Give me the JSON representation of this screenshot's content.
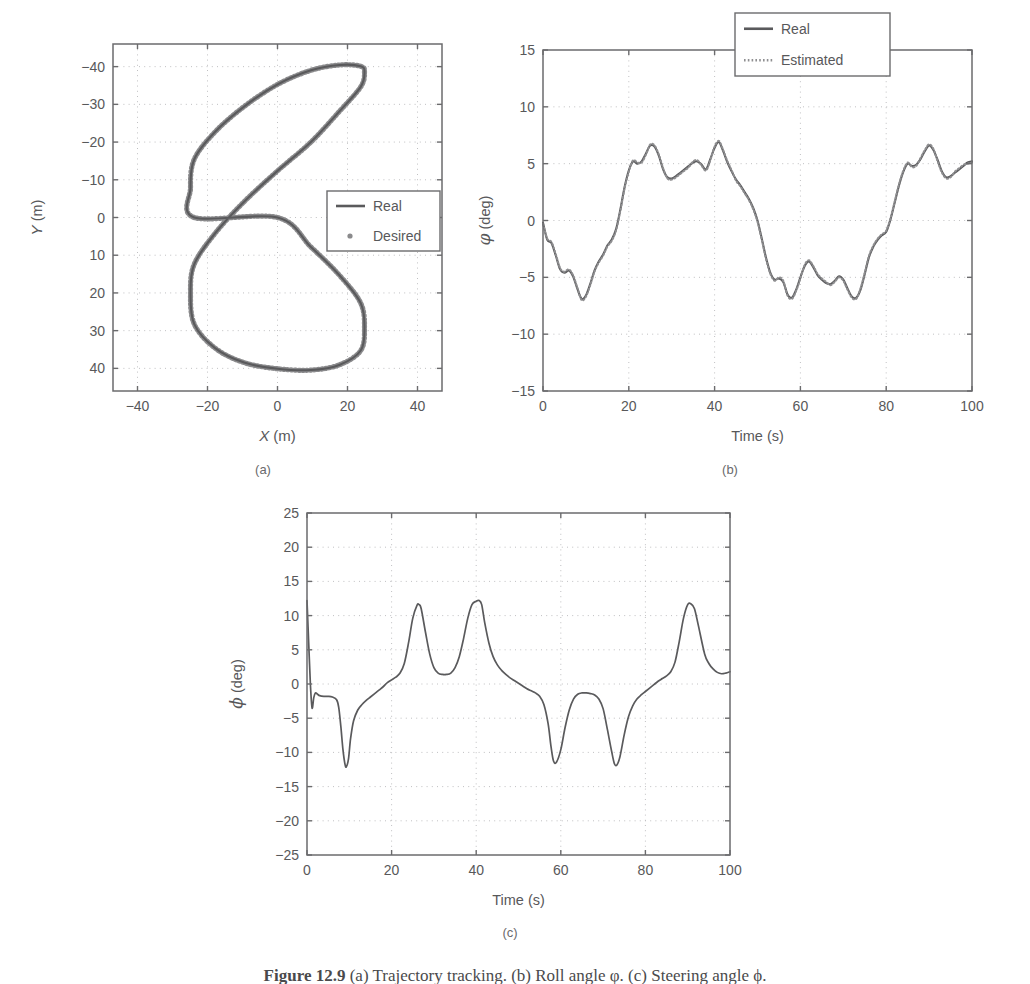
{
  "figure": {
    "caption_label": "Figure 12.9",
    "caption_text": "  (a) Trajectory tracking. (b) Roll angle φ. (c) Steering angle ϕ.",
    "subcaptions": [
      "(a)",
      "(b)",
      "(c)"
    ]
  },
  "style": {
    "line_real": "#5a5a5c",
    "line_estimated": "#8f8f91",
    "marker_desired": "#8a8a8c",
    "axis": "#6b6b6d",
    "grid": "#b9b9bb",
    "background": "#ffffff"
  },
  "chart_data": [
    {
      "id": "panel-a",
      "type": "line",
      "title": "",
      "xlabel": "X (m)",
      "ylabel": "Y (m)",
      "xlim": [
        -47,
        47
      ],
      "ylim": [
        -46,
        46
      ],
      "y_inverted": true,
      "xticks": [
        -40,
        -20,
        0,
        20,
        40
      ],
      "yticks": [
        -40,
        -30,
        -20,
        -10,
        0,
        10,
        20,
        30,
        40
      ],
      "xtick_labels": [
        "-40",
        "-20",
        "0",
        "20",
        "40"
      ],
      "ytick_labels": [
        "-40",
        "-30",
        "-20",
        "-10",
        "0",
        "10",
        "20",
        "30",
        "40"
      ],
      "grid": true,
      "legend_position": "center-right",
      "legend": [
        {
          "label": "Real",
          "style": "line",
          "color": "#5a5a5c"
        },
        {
          "label": "Desired",
          "style": "marker",
          "color": "#8a8a8c"
        }
      ],
      "series": [
        {
          "name": "Real",
          "style": "line",
          "comment": "figure-eight lemniscate: x = 25*sin(2t), y = 40*sin(t), t=0..2pi",
          "points": [
            [
              0.0,
              0.0
            ],
            [
              9.55,
              7.82
            ],
            [
              17.82,
              15.45
            ],
            [
              23.78,
              22.71
            ],
            [
              24.85,
              29.41
            ],
            [
              23.78,
              35.27
            ],
            [
              17.82,
              39.02
            ],
            [
              9.55,
              40.45
            ],
            [
              0.0,
              40.1
            ],
            [
              -9.55,
              38.47
            ],
            [
              -17.82,
              34.64
            ],
            [
              -23.78,
              28.28
            ],
            [
              -24.85,
              20.0
            ],
            [
              -23.78,
              12.36
            ],
            [
              -17.82,
              4.18
            ],
            [
              -9.55,
              -4.18
            ],
            [
              0.0,
              -12.36
            ],
            [
              9.55,
              -20.0
            ],
            [
              17.82,
              -28.28
            ],
            [
              23.78,
              -34.64
            ],
            [
              24.85,
              -38.47
            ],
            [
              23.78,
              -40.1
            ],
            [
              17.82,
              -40.45
            ],
            [
              9.55,
              -39.02
            ],
            [
              0.0,
              -35.27
            ],
            [
              -9.55,
              -29.41
            ],
            [
              -17.82,
              -22.71
            ],
            [
              -23.78,
              -15.45
            ],
            [
              -24.85,
              -7.82
            ],
            [
              -23.78,
              0.0
            ]
          ]
        }
      ]
    },
    {
      "id": "panel-b",
      "type": "line",
      "title": "",
      "xlabel": "Time (s)",
      "ylabel": "φ (deg)",
      "xlim": [
        0,
        100
      ],
      "ylim": [
        -15,
        15
      ],
      "xticks": [
        0,
        20,
        40,
        60,
        80,
        100
      ],
      "yticks": [
        -15,
        -10,
        -5,
        0,
        5,
        10,
        15
      ],
      "xtick_labels": [
        "0",
        "20",
        "40",
        "60",
        "80",
        "100"
      ],
      "ytick_labels": [
        "-15",
        "-10",
        "-5",
        "0",
        "5",
        "10",
        "15"
      ],
      "grid": true,
      "legend_position": "top-right",
      "legend": [
        {
          "label": "Real",
          "style": "line",
          "color": "#5a5a5c"
        },
        {
          "label": "Estimated",
          "style": "dashed",
          "color": "#8f8f91"
        }
      ],
      "series": [
        {
          "name": "Real",
          "style": "line",
          "x": [
            0,
            1,
            2,
            3,
            4,
            5,
            6,
            7,
            8,
            9,
            10,
            11,
            12,
            13,
            14,
            15,
            16,
            17,
            18,
            19,
            20,
            21,
            22,
            23,
            24,
            25,
            26,
            27,
            28,
            29,
            30,
            31,
            32,
            33,
            34,
            35,
            36,
            37,
            38,
            39,
            40,
            41,
            42,
            43,
            44,
            45,
            46,
            47,
            48,
            49,
            50,
            51,
            52,
            53,
            54,
            55,
            56,
            57,
            58,
            59,
            60,
            61,
            62,
            63,
            64,
            65,
            66,
            67,
            68,
            69,
            70,
            71,
            72,
            73,
            74,
            75,
            76,
            77,
            78,
            79,
            80,
            81,
            82,
            83,
            84,
            85,
            86,
            87,
            88,
            89,
            90,
            91,
            92,
            93,
            94,
            95,
            96,
            97,
            98,
            99,
            100
          ],
          "values": [
            -0.2,
            -1.7,
            -2.0,
            -3.1,
            -4.3,
            -4.6,
            -4.4,
            -4.9,
            -6.0,
            -6.9,
            -6.6,
            -5.6,
            -4.4,
            -3.6,
            -3.0,
            -2.2,
            -1.7,
            -0.8,
            0.9,
            2.9,
            4.4,
            5.2,
            5.0,
            5.2,
            5.9,
            6.6,
            6.5,
            5.7,
            4.5,
            3.8,
            3.7,
            3.9,
            4.2,
            4.5,
            4.8,
            5.1,
            5.2,
            4.9,
            4.5,
            5.4,
            6.4,
            6.9,
            6.1,
            5.1,
            4.3,
            3.6,
            3.1,
            2.5,
            1.9,
            1.1,
            0.0,
            -1.6,
            -3.3,
            -4.6,
            -5.2,
            -5.1,
            -5.4,
            -6.5,
            -6.8,
            -6.1,
            -5.0,
            -4.0,
            -3.6,
            -4.1,
            -4.8,
            -5.2,
            -5.5,
            -5.6,
            -5.3,
            -4.9,
            -5.2,
            -6.0,
            -6.7,
            -6.8,
            -6.1,
            -4.7,
            -3.2,
            -2.3,
            -1.7,
            -1.3,
            -1.0,
            0.1,
            1.6,
            3.1,
            4.3,
            5.0,
            4.8,
            4.9,
            5.4,
            6.1,
            6.6,
            6.2,
            5.3,
            4.3,
            3.8,
            3.9,
            4.2,
            4.5,
            4.8,
            5.1,
            5.2
          ]
        },
        {
          "name": "Estimated",
          "style": "dashed",
          "x": [
            0,
            1,
            2,
            3,
            4,
            5,
            6,
            7,
            8,
            9,
            10,
            11,
            12,
            13,
            14,
            15,
            16,
            17,
            18,
            19,
            20,
            21,
            22,
            23,
            24,
            25,
            26,
            27,
            28,
            29,
            30,
            31,
            32,
            33,
            34,
            35,
            36,
            37,
            38,
            39,
            40,
            41,
            42,
            43,
            44,
            45,
            46,
            47,
            48,
            49,
            50,
            51,
            52,
            53,
            54,
            55,
            56,
            57,
            58,
            59,
            60,
            61,
            62,
            63,
            64,
            65,
            66,
            67,
            68,
            69,
            70,
            71,
            72,
            73,
            74,
            75,
            76,
            77,
            78,
            79,
            80,
            81,
            82,
            83,
            84,
            85,
            86,
            87,
            88,
            89,
            90,
            91,
            92,
            93,
            94,
            95,
            96,
            97,
            98,
            99,
            100
          ],
          "values": [
            -0.3,
            -1.6,
            -1.9,
            -3.0,
            -4.2,
            -4.5,
            -4.3,
            -4.8,
            -5.9,
            -7.0,
            -6.7,
            -5.7,
            -4.5,
            -3.7,
            -3.1,
            -2.3,
            -1.8,
            -0.9,
            0.8,
            2.8,
            4.3,
            5.3,
            5.1,
            5.1,
            5.8,
            6.7,
            6.6,
            5.8,
            4.6,
            3.7,
            3.6,
            3.8,
            4.1,
            4.4,
            4.7,
            5.2,
            5.3,
            4.8,
            4.4,
            5.3,
            6.5,
            7.0,
            6.2,
            5.2,
            4.4,
            3.5,
            3.0,
            2.4,
            1.8,
            1.0,
            -0.1,
            -1.7,
            -3.4,
            -4.7,
            -5.3,
            -5.0,
            -5.3,
            -6.6,
            -6.9,
            -6.2,
            -5.1,
            -3.9,
            -3.5,
            -4.0,
            -4.7,
            -5.1,
            -5.4,
            -5.7,
            -5.4,
            -5.0,
            -5.3,
            -6.1,
            -6.8,
            -6.9,
            -6.0,
            -4.6,
            -3.1,
            -2.2,
            -1.6,
            -1.2,
            -0.9,
            0.2,
            1.7,
            3.2,
            4.4,
            5.1,
            4.7,
            4.8,
            5.5,
            6.2,
            6.7,
            6.3,
            5.2,
            4.2,
            3.7,
            3.8,
            4.3,
            4.6,
            4.9,
            5.0,
            5.1
          ]
        }
      ]
    },
    {
      "id": "panel-c",
      "type": "line",
      "title": "",
      "xlabel": "Time (s)",
      "ylabel": "ϕ (deg)",
      "xlim": [
        0,
        100
      ],
      "ylim": [
        -25,
        25
      ],
      "xticks": [
        0,
        20,
        40,
        60,
        80,
        100
      ],
      "yticks": [
        -25,
        -20,
        -15,
        -10,
        -5,
        0,
        5,
        10,
        15,
        20,
        25
      ],
      "xtick_labels": [
        "0",
        "20",
        "40",
        "60",
        "80",
        "100"
      ],
      "ytick_labels": [
        "-25",
        "-20",
        "-15",
        "-10",
        "-5",
        "0",
        "5",
        "10",
        "15",
        "20",
        "25"
      ],
      "grid": true,
      "legend_position": "none",
      "legend": [],
      "series": [
        {
          "name": "Steering angle",
          "style": "line",
          "x": [
            0,
            0.4,
            0.8,
            1.2,
            1.6,
            2,
            2.5,
            3,
            4,
            5,
            6,
            7,
            7.5,
            8,
            8.5,
            9,
            9.3,
            9.8,
            10.3,
            11,
            12,
            13,
            14,
            15,
            16,
            17,
            18,
            19,
            20,
            21,
            22,
            23,
            24,
            25,
            26,
            26.5,
            27,
            28,
            29,
            30,
            31,
            32,
            33,
            34,
            35,
            36,
            37,
            38,
            39,
            40,
            40.7,
            41.3,
            42,
            43,
            44,
            45,
            46,
            47,
            48,
            49,
            50,
            51,
            52,
            53,
            54,
            55,
            56,
            57,
            57.7,
            58.3,
            59,
            60,
            61,
            62,
            63,
            64,
            65,
            66,
            67,
            68,
            69,
            70,
            71,
            72,
            72.7,
            73.3,
            74,
            75,
            76,
            77,
            78,
            79,
            80,
            81,
            82,
            83,
            84,
            85,
            86,
            87,
            88,
            89,
            90,
            90.8,
            91.6,
            92.5,
            94,
            95,
            96,
            97,
            98,
            99,
            100
          ],
          "values": [
            12.2,
            6.0,
            0.0,
            -3.5,
            -2.0,
            -1.3,
            -1.5,
            -1.7,
            -1.8,
            -1.8,
            -1.9,
            -2.3,
            -3.4,
            -6.2,
            -9.6,
            -11.8,
            -12.1,
            -11.0,
            -8.0,
            -5.4,
            -3.8,
            -3.0,
            -2.4,
            -1.9,
            -1.4,
            -0.9,
            -0.4,
            0.2,
            0.6,
            1.0,
            1.6,
            3.0,
            6.0,
            9.6,
            11.5,
            11.6,
            11.0,
            7.6,
            4.4,
            2.4,
            1.6,
            1.4,
            1.4,
            1.6,
            2.4,
            4.0,
            6.6,
            9.6,
            11.6,
            12.1,
            12.2,
            11.6,
            9.0,
            6.0,
            4.0,
            2.8,
            2.0,
            1.4,
            0.9,
            0.5,
            0.1,
            -0.3,
            -0.7,
            -1.0,
            -1.3,
            -1.8,
            -3.0,
            -5.8,
            -9.2,
            -11.3,
            -11.4,
            -9.6,
            -6.4,
            -3.8,
            -2.2,
            -1.5,
            -1.3,
            -1.3,
            -1.4,
            -1.6,
            -2.2,
            -3.6,
            -6.6,
            -9.8,
            -11.7,
            -11.8,
            -10.6,
            -7.4,
            -4.8,
            -3.2,
            -2.2,
            -1.6,
            -1.1,
            -0.6,
            -0.1,
            0.4,
            0.8,
            1.2,
            1.8,
            3.2,
            6.2,
            9.6,
            11.6,
            11.7,
            11.0,
            8.6,
            4.4,
            3.0,
            2.2,
            1.7,
            1.5,
            1.6,
            1.8
          ]
        }
      ]
    }
  ]
}
